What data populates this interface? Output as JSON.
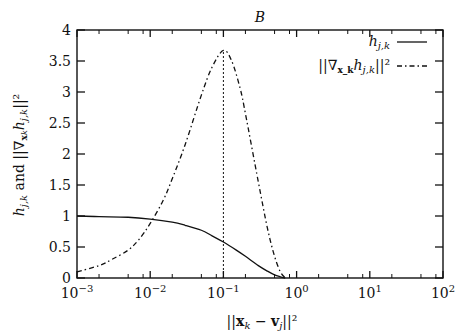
{
  "chart_data": {
    "type": "line",
    "title": "B",
    "xlabel": "||x_k − v_j||²",
    "ylabel": "h_{j,k} and ||∇_{x_k} h_{j,k}||²",
    "xscale": "log",
    "xlim": [
      0.001,
      100
    ],
    "ylim": [
      0,
      4
    ],
    "x_ticks": [
      0.001,
      0.01,
      0.1,
      1,
      10,
      100
    ],
    "x_tick_labels": [
      "10",
      "10",
      "10",
      "10",
      "10",
      "10"
    ],
    "x_tick_exponents": [
      "−3",
      "−2",
      "−1",
      "0",
      "1",
      "2"
    ],
    "y_ticks": [
      0,
      0.5,
      1,
      1.5,
      2,
      2.5,
      3,
      3.5,
      4
    ],
    "y_tick_labels": [
      "0",
      "0.5",
      "1",
      "1.5",
      "2",
      "2.5",
      "3",
      "3.5",
      "4"
    ],
    "grid": false,
    "legend_position": "upper right",
    "vline": {
      "x": 0.1,
      "style": "dotted"
    },
    "series": [
      {
        "name": "h_{j,k}",
        "style": "solid",
        "x": [
          0.001,
          0.002,
          0.005,
          0.01,
          0.02,
          0.03,
          0.05,
          0.07,
          0.1,
          0.15,
          0.2,
          0.3,
          0.4,
          0.5,
          0.6,
          0.7
        ],
        "values": [
          1.0,
          0.99,
          0.98,
          0.95,
          0.9,
          0.85,
          0.77,
          0.68,
          0.58,
          0.45,
          0.35,
          0.2,
          0.11,
          0.05,
          0.02,
          0.0
        ]
      },
      {
        "name": "||∇_{x_k} h_{j,k}||²",
        "style": "dashdot",
        "x": [
          0.001,
          0.002,
          0.003,
          0.005,
          0.007,
          0.01,
          0.015,
          0.02,
          0.03,
          0.05,
          0.07,
          0.1,
          0.13,
          0.17,
          0.2,
          0.3,
          0.4,
          0.5,
          0.6,
          0.7
        ],
        "values": [
          0.1,
          0.2,
          0.3,
          0.45,
          0.62,
          0.88,
          1.25,
          1.6,
          2.15,
          2.95,
          3.4,
          3.67,
          3.5,
          3.05,
          2.65,
          1.55,
          0.8,
          0.35,
          0.1,
          0.0
        ]
      }
    ]
  },
  "legend": {
    "items": [
      {
        "label": "h",
        "sub": "j,k",
        "style": "solid"
      },
      {
        "label": "||∇",
        "sub": "x_k",
        "label2": "h",
        "sub2": "j,k",
        "label3": "||²",
        "style": "dashdot"
      }
    ]
  }
}
